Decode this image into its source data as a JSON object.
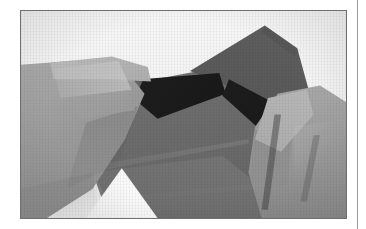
{
  "page": {
    "kind": "book-plate",
    "background_color": "#ffffff",
    "width_px": 366,
    "height_px": 229
  },
  "photo": {
    "caption": "",
    "alt": "Two hands folding a sheet of gray origami paper with dark triangular facets",
    "subject": "origami-folding-step",
    "border_color": "#6f6f6f",
    "frame": {
      "left_px": 20,
      "top_px": 10,
      "width_px": 327,
      "height_px": 209
    },
    "palette": {
      "surface_white": "#f2f2f2",
      "paper_mid_gray": "#6e6e6e",
      "paper_dark_gray": "#565656",
      "paper_reverse_black": "#1a1a1a",
      "skin_light": "#b3b3b3",
      "skin_mid": "#969696",
      "skin_shadow": "#7c7c7c",
      "highlight_white": "#ffffff"
    },
    "elements": {
      "left_hand": "left-hand-gripping-paper",
      "right_hand": "right-hand-pinching-paper-edge",
      "paper_front_panel": "large-mid-gray-front-facet",
      "paper_upper_flap": "tall-upper-right-flap",
      "paper_dark_wedges": "dark-reverse-side-bowtie-wedges",
      "paper_left_flap": "left-flap-held-by-fingers",
      "white_lift_highlight": "bright-white-lift-at-bottom-left"
    }
  },
  "column_rule": {
    "color": "#9a9a9a",
    "left_px": 357,
    "width_px": 1
  }
}
